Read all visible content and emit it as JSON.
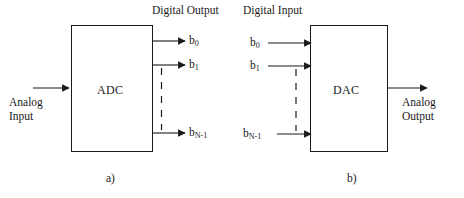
{
  "figure": {
    "type": "block-diagram",
    "background": "#ffffff",
    "line_color": "#1a1a1a",
    "panels": [
      {
        "id": "adc",
        "caption": "a)",
        "block_label": "ADC",
        "header": "Digital Output",
        "header_side": "right",
        "input": {
          "label": "Analog\nInput",
          "kind": "analog",
          "side": "left"
        },
        "outputs": {
          "kind": "digital",
          "side": "right",
          "bits": [
            {
              "base": "b",
              "sub": "0"
            },
            {
              "base": "b",
              "sub": "1"
            },
            {
              "base": "b",
              "sub": "N-1"
            }
          ],
          "ellipsis": "vertical-dashed"
        }
      },
      {
        "id": "dac",
        "caption": "b)",
        "block_label": "DAC",
        "header": "Digital Input",
        "header_side": "left",
        "inputs": {
          "kind": "digital",
          "side": "left",
          "bits": [
            {
              "base": "b",
              "sub": "0"
            },
            {
              "base": "b",
              "sub": "1"
            },
            {
              "base": "b",
              "sub": "N-1"
            }
          ],
          "ellipsis": "vertical-dashed"
        },
        "output": {
          "label": "Analog\nOutput",
          "kind": "analog",
          "side": "right"
        }
      }
    ]
  }
}
